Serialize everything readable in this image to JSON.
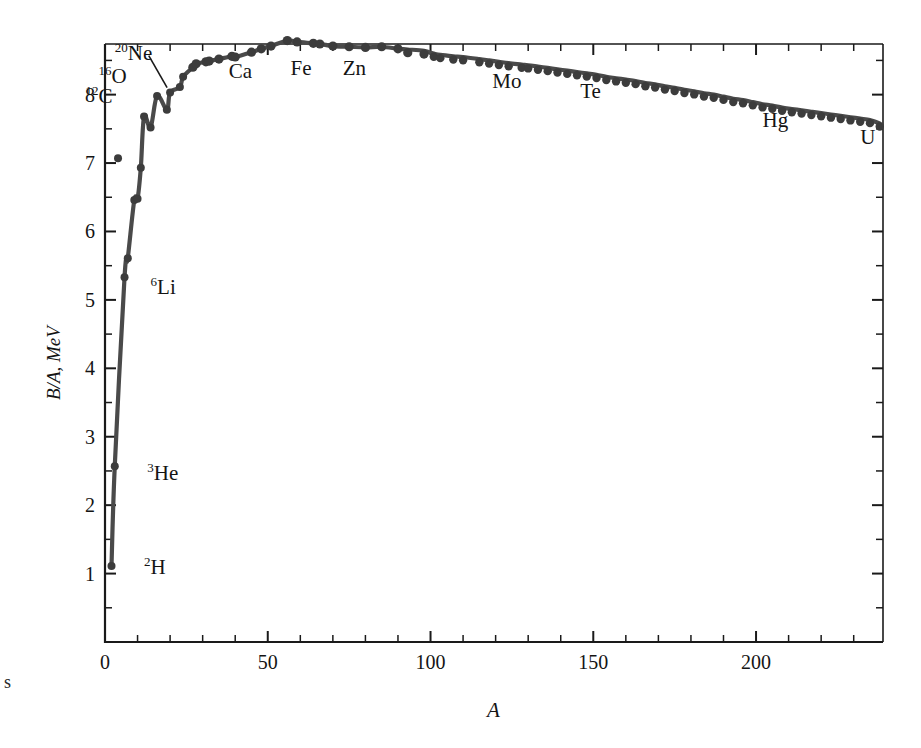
{
  "figure": {
    "background_color": "#ffffff",
    "curve_color": "#4a4a4a",
    "marker_color": "#3c3c3c",
    "axis_color": "#1a1a1a",
    "edge_caption": "s"
  },
  "chart_data": {
    "type": "line",
    "title": "",
    "subtitle": "",
    "xlabel": "A",
    "ylabel": "B/A, MeV",
    "xlim": [
      0,
      239
    ],
    "ylim": [
      0,
      8.74
    ],
    "grid": false,
    "legend": "none",
    "x_major_ticks": [
      0,
      50,
      100,
      150,
      200
    ],
    "x_major_tick_labels": [
      "0",
      "50",
      "100",
      "150",
      "200"
    ],
    "x_minor_tick_step": 10,
    "y_major_ticks": [
      1,
      2,
      3,
      4,
      5,
      6,
      7,
      8
    ],
    "y_major_tick_labels": [
      "1",
      "2",
      "3",
      "4",
      "5",
      "6",
      "7",
      "8"
    ],
    "y_minor_tick_step": 0.5,
    "series": [
      {
        "name": "Binding energy per nucleon",
        "x": [
          2,
          3,
          4,
          6,
          7,
          9,
          10,
          11,
          12,
          14,
          16,
          19,
          20,
          23,
          24,
          27,
          28,
          31,
          32,
          35,
          39,
          40,
          45,
          48,
          51,
          56,
          59,
          64,
          66,
          70,
          75,
          80,
          85,
          90,
          93,
          98,
          101,
          103,
          107,
          110,
          115,
          118,
          121,
          124,
          128,
          130,
          133,
          136,
          139,
          142,
          145,
          148,
          151,
          154,
          157,
          160,
          163,
          166,
          169,
          172,
          175,
          178,
          181,
          184,
          187,
          190,
          193,
          196,
          199,
          202,
          205,
          208,
          211,
          214,
          217,
          220,
          223,
          226,
          229,
          232,
          235,
          238
        ],
        "y": [
          1.11,
          2.57,
          7.07,
          5.33,
          5.61,
          6.46,
          6.48,
          6.93,
          7.68,
          7.52,
          7.98,
          7.78,
          8.03,
          8.11,
          8.26,
          8.4,
          8.45,
          8.48,
          8.49,
          8.52,
          8.56,
          8.55,
          8.62,
          8.67,
          8.71,
          8.79,
          8.77,
          8.75,
          8.74,
          8.71,
          8.7,
          8.69,
          8.7,
          8.67,
          8.66,
          8.64,
          8.6,
          8.58,
          8.56,
          8.55,
          8.52,
          8.5,
          8.48,
          8.46,
          8.44,
          8.43,
          8.41,
          8.39,
          8.37,
          8.35,
          8.33,
          8.31,
          8.29,
          8.26,
          8.24,
          8.22,
          8.2,
          8.17,
          8.15,
          8.12,
          8.1,
          8.07,
          8.05,
          8.02,
          8.0,
          7.97,
          7.94,
          7.92,
          7.89,
          7.86,
          7.84,
          7.81,
          7.79,
          7.77,
          7.75,
          7.73,
          7.71,
          7.69,
          7.67,
          7.65,
          7.63,
          7.58
        ]
      }
    ],
    "annotations": [
      {
        "text": "2H",
        "isotope_mass": "2",
        "element": "H",
        "x": 2,
        "y": 1.11,
        "label_x": 12,
        "label_y": 1.08,
        "leader": false
      },
      {
        "text": "3He",
        "isotope_mass": "3",
        "element": "He",
        "x": 3,
        "y": 2.57,
        "label_x": 13,
        "label_y": 2.45,
        "leader": false
      },
      {
        "text": "6Li",
        "isotope_mass": "6",
        "element": "Li",
        "x": 6,
        "y": 5.33,
        "label_x": 14,
        "label_y": 5.18,
        "leader": false
      },
      {
        "text": "12C",
        "isotope_mass": "12",
        "element": "C",
        "x": 12,
        "y": 7.68,
        "label_x": -6,
        "label_y": 7.96,
        "leader": false
      },
      {
        "text": "16O",
        "isotope_mass": "16",
        "element": "O",
        "x": 16,
        "y": 7.98,
        "label_x": -2,
        "label_y": 8.26,
        "leader": false
      },
      {
        "text": "20Ne",
        "isotope_mass": "20",
        "element": "Ne",
        "x": 20,
        "y": 8.03,
        "label_x": 3,
        "label_y": 8.6,
        "leader": true
      },
      {
        "text": "Ca",
        "isotope_mass": "",
        "element": "Ca",
        "x": 40,
        "y": 8.55,
        "label_x": 38,
        "label_y": 8.33,
        "leader": false
      },
      {
        "text": "Fe",
        "isotope_mass": "",
        "element": "Fe",
        "x": 56,
        "y": 8.79,
        "label_x": 57,
        "label_y": 8.37,
        "leader": false
      },
      {
        "text": "Zn",
        "isotope_mass": "",
        "element": "Zn",
        "x": 66,
        "y": 8.74,
        "label_x": 73,
        "label_y": 8.37,
        "leader": false
      },
      {
        "text": "Mo",
        "isotope_mass": "",
        "element": "Mo",
        "x": 98,
        "y": 8.64,
        "label_x": 119,
        "label_y": 8.19,
        "leader": false
      },
      {
        "text": "Te",
        "isotope_mass": "",
        "element": "Te",
        "x": 128,
        "y": 8.44,
        "label_x": 146,
        "label_y": 8.04,
        "leader": false
      },
      {
        "text": "Hg",
        "isotope_mass": "",
        "element": "Hg",
        "x": 200,
        "y": 7.87,
        "label_x": 202,
        "label_y": 7.62,
        "leader": false
      },
      {
        "text": "U",
        "isotope_mass": "",
        "element": "U",
        "x": 238,
        "y": 7.58,
        "label_x": 232,
        "label_y": 7.37,
        "leader": false
      }
    ]
  }
}
